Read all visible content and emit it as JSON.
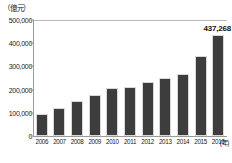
{
  "chart_data": {
    "type": "bar",
    "title": "",
    "unit_label": "（億元）",
    "xlabel": "(年)",
    "ylabel": "",
    "categories": [
      "2006",
      "2007",
      "2008",
      "2009",
      "2010",
      "2011",
      "2012",
      "2013",
      "2014",
      "2015",
      "2016"
    ],
    "values": [
      95000,
      120000,
      150000,
      178000,
      205000,
      212000,
      232000,
      248000,
      268000,
      345000,
      437268
    ],
    "ylim": [
      0,
      500000
    ],
    "yticks": [
      0,
      100000,
      200000,
      300000,
      400000,
      500000
    ],
    "ytick_labels": [
      "0",
      "100,000",
      "200,000",
      "300,000",
      "400,000",
      "500,000"
    ],
    "grid": false,
    "legend": "none",
    "annotations": [
      {
        "category": "2016",
        "text": "437,268",
        "value": 437268
      }
    ],
    "bar_color": "#3d3d3d",
    "axis_color": "#9a9a9a",
    "background_color": "#ffffff"
  }
}
